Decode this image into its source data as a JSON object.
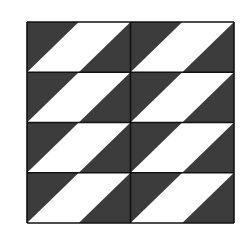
{
  "figure": {
    "grid": {
      "columns": 2,
      "rows": 4,
      "x0": 27,
      "y0": 22,
      "x1": 234,
      "y1": 223
    },
    "cell_fill": {
      "dark": "#3c3c3c",
      "light": "#ffffff",
      "line": "#111111"
    },
    "stripe_shape": "parallelogram: top edge from 50% to 100% of cell width, bottom edge from 0% to 50%"
  }
}
